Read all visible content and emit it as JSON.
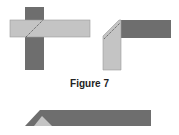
{
  "caption": "Figure 7",
  "colors": {
    "dark": "#6e6e6e",
    "light": "#c4c4c4",
    "outline": "#8a8a8a",
    "dotted": "#444444"
  },
  "figures": [
    {
      "name": "overlapping-strips",
      "description": "Light horizontal strip over dark vertical strip with dotted diagonal fold line"
    },
    {
      "name": "folded-corner",
      "description": "Strip folded at right angle with mitred corner and dotted fold line"
    },
    {
      "name": "folded-edge",
      "description": "Long dark strip with folded triangular end showing light underside"
    }
  ]
}
